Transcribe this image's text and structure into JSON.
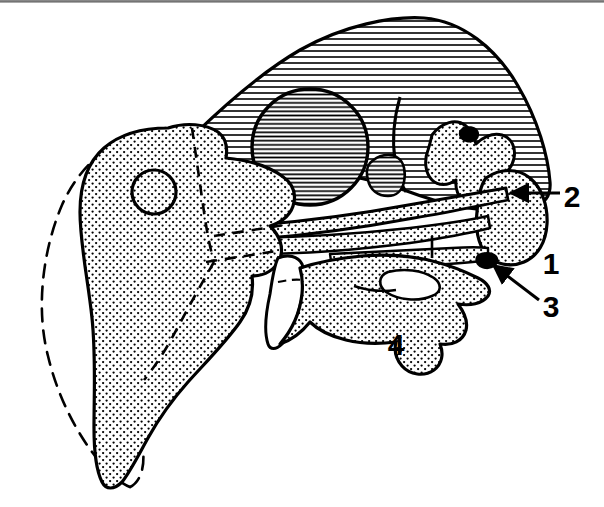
{
  "figure": {
    "type": "anatomical-line-drawing",
    "width": 604,
    "height": 507,
    "background_color": "#ffffff",
    "ink_color": "#000000"
  },
  "legend_labels": [
    {
      "id": "label-1",
      "text": "1",
      "x": 551,
      "y": 274,
      "has_leader_line": false,
      "description": "unlabeled leader-free numeral beside rounded posterior stippled element"
    },
    {
      "id": "label-2",
      "text": "2",
      "x": 566,
      "y": 207,
      "has_leader_line": true,
      "leader": {
        "type": "straight-arrow",
        "from_x": 560,
        "from_y": 193,
        "to_x": 506,
        "to_y": 193,
        "arrowhead": "solid-triangle"
      }
    },
    {
      "id": "label-3",
      "text": "3",
      "x": 545,
      "y": 317,
      "has_leader_line": true,
      "leader": {
        "type": "straight-arrow",
        "from_x": 539,
        "from_y": 300,
        "to_x": 489,
        "to_y": 262,
        "arrowhead": "solid-triangle"
      }
    },
    {
      "id": "label-4",
      "text": "4",
      "x": 390,
      "y": 355,
      "has_leader_line": false,
      "description": "numeral sitting below the ventral margin of the lower stippled element"
    }
  ],
  "regions": [
    {
      "id": "cranium",
      "name": "cranium-hatched-region",
      "fill_pattern": "horizontal-hatch",
      "pattern_spacing_px": 6,
      "description": "Large dome-shaped upper region filled with evenly spaced horizontal rule lines"
    },
    {
      "id": "orbit",
      "name": "orbit-circle",
      "fill_pattern": "dense-horizontal-hatch",
      "pattern_spacing_px": 4,
      "center_x": 310,
      "center_y": 147,
      "radius": 58,
      "description": "Large circular orbit with denser horizontal hatching"
    },
    {
      "id": "opercle",
      "name": "opercle-stippled-region",
      "fill_pattern": "stipple-dots",
      "pattern_spacing_px": 7,
      "description": "Large teardrop shaped stippled mass on the left occupying lower-left of the figure"
    },
    {
      "id": "opercle-foramen",
      "name": "foramen-circle",
      "fill_pattern": "stipple-dots",
      "center_x": 154,
      "center_y": 192,
      "radius": 22,
      "description": "Small circle outlined within the left stippled mass"
    },
    {
      "id": "lower-jaw",
      "name": "lower-jaw-stippled-region",
      "fill_pattern": "stipple-dots",
      "description": "Broad stippled region forming the ventral jaw and cheek"
    },
    {
      "id": "posterior-lobe",
      "name": "posterior-rounded-stippled-lobe",
      "fill_pattern": "stipple-dots",
      "description": "Rounded stippled lobe at far right adjacent to labels 1 and 2"
    },
    {
      "id": "ghost-outline",
      "name": "dashed-ghost-outline",
      "fill_pattern": "none",
      "stroke_style": "dashed",
      "description": "Large dashed contour on the left and bottom indicating a hidden or reconstructed outline"
    },
    {
      "id": "suture-lines",
      "name": "dashed-suture-lines",
      "fill_pattern": "none",
      "stroke_style": "dashed",
      "description": "Interior dashed lines marking sutures across the stippled masses"
    },
    {
      "id": "bar-elements",
      "name": "elongate-bar-elements",
      "fill_pattern": "stipple-dots",
      "description": "Narrow elongate stippled bars crossing the mid-face diagonally"
    }
  ]
}
